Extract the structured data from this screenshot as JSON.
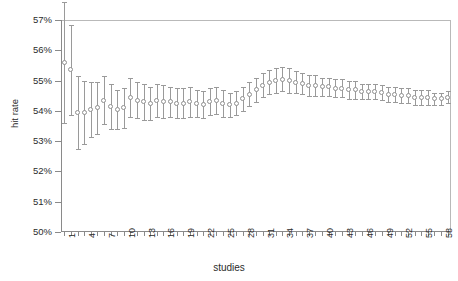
{
  "chart_data": {
    "type": "scatter",
    "title": "",
    "xlabel": "studies",
    "ylabel": "hit rate",
    "ylim": [
      50,
      57
    ],
    "ytick_labels": [
      "50%",
      "51%",
      "52%",
      "53%",
      "54%",
      "55%",
      "56%",
      "57%"
    ],
    "ytick_values": [
      50,
      51,
      52,
      53,
      54,
      55,
      56,
      57
    ],
    "xtick_labels": [
      "1",
      "4",
      "7",
      "10",
      "13",
      "16",
      "19",
      "22",
      "25",
      "28",
      "31",
      "34",
      "37",
      "40",
      "43",
      "46",
      "49",
      "52",
      "55",
      "58"
    ],
    "xtick_values": [
      1,
      4,
      7,
      10,
      13,
      16,
      19,
      22,
      25,
      28,
      31,
      34,
      37,
      40,
      43,
      46,
      49,
      52,
      55,
      58
    ],
    "xlim": [
      0.5,
      59.5
    ],
    "grid": false,
    "legend": null,
    "marker": "open-circle",
    "errorbar": "95% confidence interval",
    "series": [
      {
        "name": "cumulative hit rate",
        "x": [
          1,
          2,
          3,
          4,
          5,
          6,
          7,
          8,
          9,
          10,
          11,
          12,
          13,
          14,
          15,
          16,
          17,
          18,
          19,
          20,
          21,
          22,
          23,
          24,
          25,
          26,
          27,
          28,
          29,
          30,
          31,
          32,
          33,
          34,
          35,
          36,
          37,
          38,
          39,
          40,
          41,
          42,
          43,
          44,
          45,
          46,
          47,
          48,
          49,
          50,
          51,
          52,
          53,
          54,
          55,
          56,
          57,
          58,
          59
        ],
        "values": [
          55.6,
          55.35,
          53.95,
          53.95,
          54.05,
          54.1,
          54.35,
          54.15,
          54.05,
          54.1,
          54.45,
          54.35,
          54.3,
          54.25,
          54.35,
          54.3,
          54.3,
          54.25,
          54.25,
          54.3,
          54.25,
          54.2,
          54.3,
          54.35,
          54.25,
          54.2,
          54.25,
          54.4,
          54.55,
          54.7,
          54.85,
          54.95,
          55.0,
          55.05,
          55.0,
          54.95,
          54.9,
          54.85,
          54.85,
          54.8,
          54.8,
          54.75,
          54.75,
          54.7,
          54.7,
          54.65,
          54.65,
          54.65,
          54.6,
          54.55,
          54.55,
          54.5,
          54.5,
          54.45,
          54.45,
          54.45,
          54.4,
          54.4,
          54.45
        ],
        "ci_low": [
          53.6,
          53.85,
          52.75,
          52.9,
          53.15,
          53.25,
          53.55,
          53.4,
          53.4,
          53.45,
          53.8,
          53.75,
          53.7,
          53.7,
          53.8,
          53.75,
          53.8,
          53.75,
          53.75,
          53.8,
          53.8,
          53.75,
          53.85,
          53.9,
          53.8,
          53.8,
          53.85,
          54.0,
          54.15,
          54.3,
          54.45,
          54.55,
          54.6,
          54.65,
          54.6,
          54.6,
          54.55,
          54.5,
          54.5,
          54.5,
          54.5,
          54.45,
          54.45,
          54.4,
          54.4,
          54.4,
          54.4,
          54.4,
          54.35,
          54.3,
          54.3,
          54.25,
          54.25,
          54.2,
          54.2,
          54.2,
          54.2,
          54.2,
          54.25
        ],
        "ci_high": [
          57.6,
          56.85,
          55.15,
          55.0,
          54.95,
          54.95,
          55.15,
          54.9,
          54.7,
          54.75,
          55.1,
          54.95,
          54.9,
          54.8,
          54.9,
          54.85,
          54.8,
          54.75,
          54.75,
          54.8,
          54.7,
          54.65,
          54.75,
          54.8,
          54.7,
          54.6,
          54.65,
          54.8,
          54.95,
          55.1,
          55.25,
          55.35,
          55.4,
          55.45,
          55.4,
          55.3,
          55.25,
          55.2,
          55.2,
          55.1,
          55.1,
          55.05,
          55.05,
          55.0,
          55.0,
          54.9,
          54.9,
          54.9,
          54.85,
          54.8,
          54.8,
          54.75,
          54.75,
          54.7,
          54.7,
          54.7,
          54.6,
          54.6,
          54.65
        ]
      }
    ]
  },
  "colors": {
    "marker_stroke": "#8f8f8f",
    "errorbar": "#9a9a9a",
    "axis": "#8a8a8a",
    "frame": "#b9b9b9",
    "text": "#2b2b2b",
    "background": "#ffffff"
  }
}
